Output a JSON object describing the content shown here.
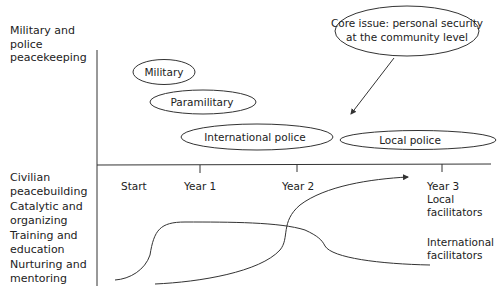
{
  "left_labels": {
    "military_police": [
      "Military and",
      "police",
      "peacekeeping"
    ],
    "civilian": [
      "Civilian",
      "peacebuilding"
    ],
    "catalytic": [
      "Catalytic and",
      "organizing"
    ],
    "training": [
      "Training and",
      "education"
    ],
    "nurturing": [
      "Nurturing and",
      "mentoring"
    ]
  },
  "ellipses": {
    "military": "Military",
    "paramilitary": "Paramilitary",
    "international_police": "International police",
    "local_police": "Local police",
    "core_issue_line1": "Core issue: personal security",
    "core_issue_line2": "at the community level"
  },
  "timeline": {
    "ticks": [
      "Start",
      "Year 1",
      "Year 2",
      "Year 3"
    ]
  },
  "curves": {
    "local": [
      "Local",
      "facilitators"
    ],
    "international": [
      "International",
      "facilitators"
    ]
  },
  "colors": {
    "line": "#333333",
    "text": "#222222",
    "background": "#ffffff"
  }
}
